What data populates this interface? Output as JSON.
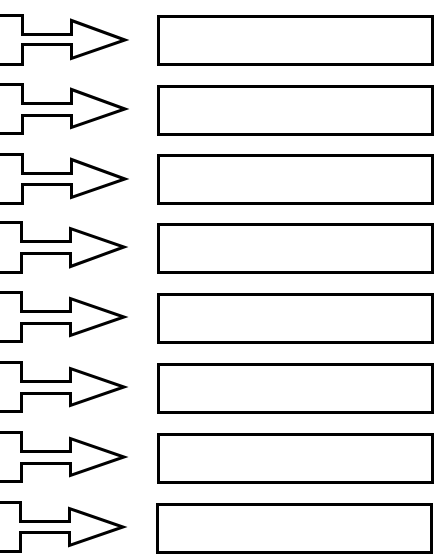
{
  "diagram": {
    "type": "arrow-to-box worksheet",
    "row_count": 8,
    "stroke_color": "#000000",
    "background_color": "#ffffff",
    "rows": [
      {
        "index": 1,
        "arrow_icon": "bracket-right-arrow-icon",
        "box_text": ""
      },
      {
        "index": 2,
        "arrow_icon": "bracket-right-arrow-icon",
        "box_text": ""
      },
      {
        "index": 3,
        "arrow_icon": "bracket-right-arrow-icon",
        "box_text": ""
      },
      {
        "index": 4,
        "arrow_icon": "bracket-right-arrow-icon",
        "box_text": ""
      },
      {
        "index": 5,
        "arrow_icon": "bracket-right-arrow-icon",
        "box_text": ""
      },
      {
        "index": 6,
        "arrow_icon": "bracket-right-arrow-icon",
        "box_text": ""
      },
      {
        "index": 7,
        "arrow_icon": "bracket-right-arrow-icon",
        "box_text": ""
      },
      {
        "index": 8,
        "arrow_icon": "bracket-right-arrow-icon",
        "box_text": ""
      }
    ]
  }
}
